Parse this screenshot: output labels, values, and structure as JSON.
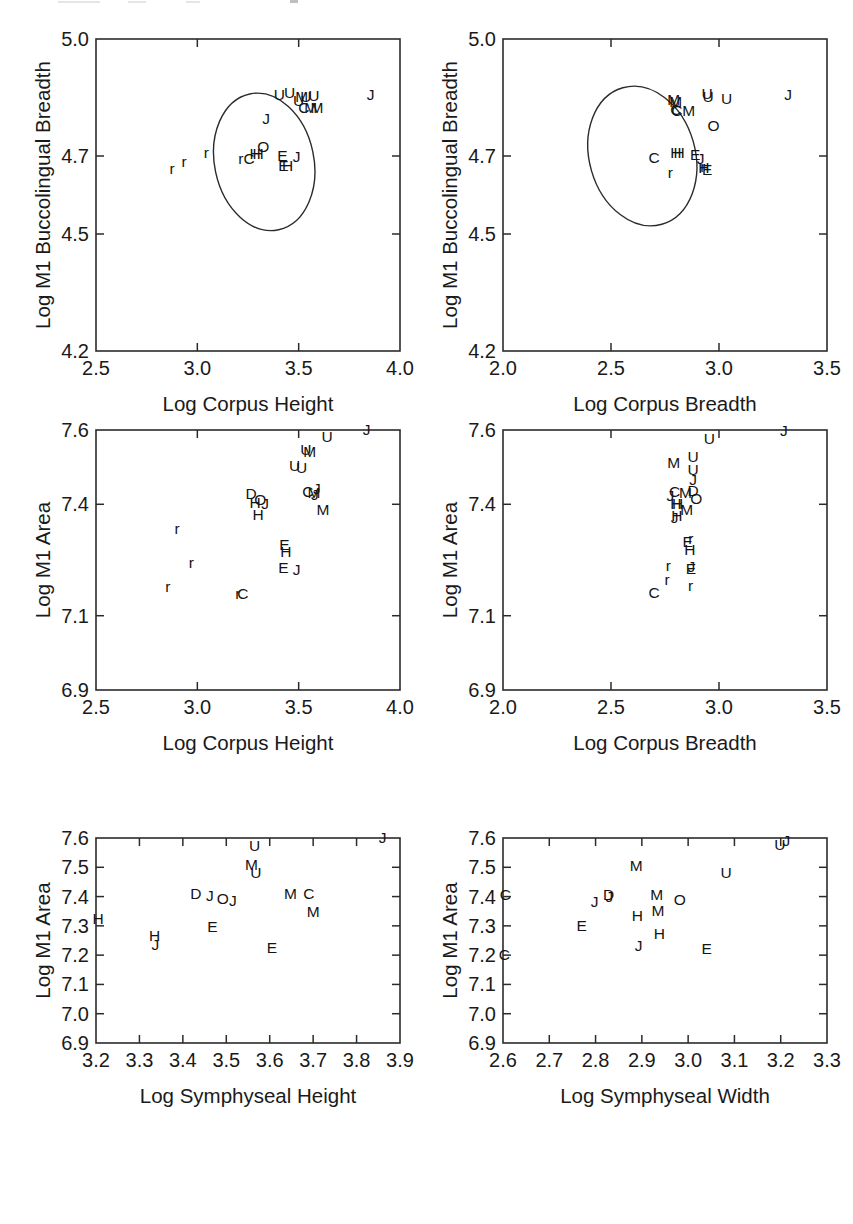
{
  "figure": {
    "title": "",
    "background": "#ffffff",
    "ink_color": "#1a1a1a",
    "panel_count": 6,
    "layout": "3 rows x 2 columns"
  },
  "chart_data": [
    {
      "id": "panel-1",
      "type": "scatter",
      "title": "",
      "xlabel": "Log Corpus Height",
      "ylabel": "Log M1 Buccolingual Breadth",
      "xlim": [
        2.5,
        4.0
      ],
      "ylim": [
        4.2,
        5.0
      ],
      "xticks": [
        2.5,
        3.0,
        3.5,
        4.0
      ],
      "xticklabels": [
        "2.5",
        "3.0",
        "3.5",
        "4.0"
      ],
      "yticks": [
        4.2,
        4.5,
        4.7,
        5.0
      ],
      "yticklabels": [
        "4.2",
        "4.5",
        "4.7",
        "5.0"
      ],
      "grid": false,
      "legend": "none",
      "marker_style": "text-letter",
      "annotations": [
        {
          "kind": "ellipse",
          "label": "confidence-ellipse",
          "cx": 3.33,
          "cy": 4.685,
          "rx": 0.245,
          "ry": 0.178,
          "rotation": -12
        }
      ],
      "points": [
        {
          "label": "r",
          "x": 2.875,
          "y": 4.665
        },
        {
          "label": "r",
          "x": 2.935,
          "y": 4.682
        },
        {
          "label": "r",
          "x": 3.045,
          "y": 4.706
        },
        {
          "label": "r",
          "x": 3.215,
          "y": 4.689
        },
        {
          "label": "C",
          "x": 3.255,
          "y": 4.69
        },
        {
          "label": "H",
          "x": 3.285,
          "y": 4.703
        },
        {
          "label": "H",
          "x": 3.3,
          "y": 4.703
        },
        {
          "label": "O",
          "x": 3.325,
          "y": 4.721
        },
        {
          "label": "J",
          "x": 3.34,
          "y": 4.793
        },
        {
          "label": "E",
          "x": 3.42,
          "y": 4.697
        },
        {
          "label": "E",
          "x": 3.425,
          "y": 4.672
        },
        {
          "label": "H",
          "x": 3.445,
          "y": 4.672
        },
        {
          "label": "J",
          "x": 3.49,
          "y": 4.696
        },
        {
          "label": "U",
          "x": 3.405,
          "y": 4.855
        },
        {
          "label": "U",
          "x": 3.455,
          "y": 4.858
        },
        {
          "label": "U",
          "x": 3.5,
          "y": 4.838
        },
        {
          "label": "M",
          "x": 3.515,
          "y": 4.848
        },
        {
          "label": "U",
          "x": 3.535,
          "y": 4.85
        },
        {
          "label": "U",
          "x": 3.575,
          "y": 4.852
        },
        {
          "label": "C",
          "x": 3.525,
          "y": 4.82
        },
        {
          "label": "M",
          "x": 3.56,
          "y": 4.82
        },
        {
          "label": "M",
          "x": 3.59,
          "y": 4.82
        },
        {
          "label": "J",
          "x": 3.855,
          "y": 4.855
        }
      ]
    },
    {
      "id": "panel-2",
      "type": "scatter",
      "title": "",
      "xlabel": "Log Corpus Breadth",
      "ylabel": "Log M1 Buccolingual Breadth",
      "xlim": [
        2.0,
        3.5
      ],
      "ylim": [
        4.2,
        5.0
      ],
      "xticks": [
        2.0,
        2.5,
        3.0,
        3.5
      ],
      "xticklabels": [
        "2.0",
        "2.5",
        "3.0",
        "3.5"
      ],
      "yticks": [
        4.2,
        4.5,
        4.7,
        5.0
      ],
      "yticklabels": [
        "4.2",
        "4.5",
        "4.7",
        "5.0"
      ],
      "grid": false,
      "legend": "none",
      "marker_style": "text-letter",
      "annotations": [
        {
          "kind": "ellipse",
          "label": "confidence-ellipse",
          "cx": 2.645,
          "cy": 4.7,
          "rx": 0.245,
          "ry": 0.182,
          "rotation": -16
        }
      ],
      "points": [
        {
          "label": "C",
          "x": 2.7,
          "y": 4.692
        },
        {
          "label": "r",
          "x": 2.775,
          "y": 4.655
        },
        {
          "label": "H",
          "x": 2.8,
          "y": 4.706
        },
        {
          "label": "H",
          "x": 2.815,
          "y": 4.706
        },
        {
          "label": "M",
          "x": 2.79,
          "y": 4.84
        },
        {
          "label": "M",
          "x": 2.8,
          "y": 4.835
        },
        {
          "label": "C",
          "x": 2.8,
          "y": 4.815
        },
        {
          "label": "C",
          "x": 2.805,
          "y": 4.812
        },
        {
          "label": "M",
          "x": 2.86,
          "y": 4.812
        },
        {
          "label": "E",
          "x": 2.89,
          "y": 4.7
        },
        {
          "label": "J",
          "x": 2.915,
          "y": 4.69
        },
        {
          "label": "r",
          "x": 2.925,
          "y": 4.67
        },
        {
          "label": "H",
          "x": 2.93,
          "y": 4.666
        },
        {
          "label": "E",
          "x": 2.945,
          "y": 4.662
        },
        {
          "label": "U",
          "x": 2.945,
          "y": 4.856
        },
        {
          "label": "U",
          "x": 2.95,
          "y": 4.848
        },
        {
          "label": "O",
          "x": 2.975,
          "y": 4.775
        },
        {
          "label": "U",
          "x": 3.035,
          "y": 4.845
        },
        {
          "label": "J",
          "x": 3.32,
          "y": 4.855
        }
      ]
    },
    {
      "id": "panel-3",
      "type": "scatter",
      "title": "",
      "xlabel": "Log Corpus Height",
      "ylabel": "Log M1 Area",
      "xlim": [
        2.5,
        4.0
      ],
      "ylim": [
        6.9,
        7.6
      ],
      "xticks": [
        2.5,
        3.0,
        3.5,
        4.0
      ],
      "xticklabels": [
        "2.5",
        "3.0",
        "3.5",
        "4.0"
      ],
      "yticks": [
        6.9,
        7.1,
        7.4,
        7.6
      ],
      "yticklabels": [
        "6.9",
        "7.1",
        "7.4",
        "7.6"
      ],
      "grid": false,
      "legend": "none",
      "marker_style": "text-letter",
      "annotations": [],
      "points": [
        {
          "label": "r",
          "x": 2.855,
          "y": 7.175
        },
        {
          "label": "r",
          "x": 2.9,
          "y": 7.33
        },
        {
          "label": "r",
          "x": 2.97,
          "y": 7.24
        },
        {
          "label": "r",
          "x": 3.2,
          "y": 7.155
        },
        {
          "label": "C",
          "x": 3.225,
          "y": 7.155
        },
        {
          "label": "D",
          "x": 3.265,
          "y": 7.425
        },
        {
          "label": "H",
          "x": 3.285,
          "y": 7.4
        },
        {
          "label": "O",
          "x": 3.31,
          "y": 7.41
        },
        {
          "label": "J",
          "x": 3.335,
          "y": 7.398
        },
        {
          "label": "H",
          "x": 3.3,
          "y": 7.368
        },
        {
          "label": "E",
          "x": 3.43,
          "y": 7.288
        },
        {
          "label": "H",
          "x": 3.437,
          "y": 7.268
        },
        {
          "label": "E",
          "x": 3.425,
          "y": 7.225
        },
        {
          "label": "J",
          "x": 3.49,
          "y": 7.22
        },
        {
          "label": "U",
          "x": 3.48,
          "y": 7.5
        },
        {
          "label": "U",
          "x": 3.515,
          "y": 7.495
        },
        {
          "label": "U",
          "x": 3.535,
          "y": 7.545
        },
        {
          "label": "M",
          "x": 3.555,
          "y": 7.538
        },
        {
          "label": "C",
          "x": 3.545,
          "y": 7.43
        },
        {
          "label": "M",
          "x": 3.575,
          "y": 7.428
        },
        {
          "label": "J",
          "x": 3.59,
          "y": 7.44
        },
        {
          "label": "J",
          "x": 3.58,
          "y": 7.422
        },
        {
          "label": "M",
          "x": 3.62,
          "y": 7.382
        },
        {
          "label": "U",
          "x": 3.64,
          "y": 7.578
        },
        {
          "label": "J",
          "x": 3.835,
          "y": 7.597
        }
      ]
    },
    {
      "id": "panel-4",
      "type": "scatter",
      "title": "",
      "xlabel": "Log Corpus Breadth",
      "ylabel": "Log M1 Area",
      "xlim": [
        2.0,
        3.5
      ],
      "ylim": [
        6.9,
        7.6
      ],
      "xticks": [
        2.0,
        2.5,
        3.0,
        3.5
      ],
      "xticklabels": [
        "2.0",
        "2.5",
        "3.0",
        "3.5"
      ],
      "yticks": [
        6.9,
        7.1,
        7.4,
        7.6
      ],
      "yticklabels": [
        "6.9",
        "7.1",
        "7.4",
        "7.6"
      ],
      "grid": false,
      "legend": "none",
      "marker_style": "text-letter",
      "annotations": [],
      "points": [
        {
          "label": "C",
          "x": 2.7,
          "y": 7.16
        },
        {
          "label": "r",
          "x": 2.76,
          "y": 7.195
        },
        {
          "label": "r",
          "x": 2.765,
          "y": 7.232
        },
        {
          "label": "J",
          "x": 2.775,
          "y": 7.42
        },
        {
          "label": "C",
          "x": 2.795,
          "y": 7.43
        },
        {
          "label": "H",
          "x": 2.8,
          "y": 7.398
        },
        {
          "label": "H",
          "x": 2.808,
          "y": 7.398
        },
        {
          "label": "J",
          "x": 2.795,
          "y": 7.36
        },
        {
          "label": "H",
          "x": 2.805,
          "y": 7.365
        },
        {
          "label": "M",
          "x": 2.79,
          "y": 7.51
        },
        {
          "label": "M",
          "x": 2.845,
          "y": 7.428
        },
        {
          "label": "M",
          "x": 2.85,
          "y": 7.382
        },
        {
          "label": "E",
          "x": 2.855,
          "y": 7.295
        },
        {
          "label": "H",
          "x": 2.865,
          "y": 7.275
        },
        {
          "label": "r",
          "x": 2.87,
          "y": 7.305
        },
        {
          "label": "E",
          "x": 2.87,
          "y": 7.222
        },
        {
          "label": "J",
          "x": 2.872,
          "y": 7.228
        },
        {
          "label": "r",
          "x": 2.868,
          "y": 7.178
        },
        {
          "label": "D",
          "x": 2.88,
          "y": 7.432
        },
        {
          "label": "O",
          "x": 2.895,
          "y": 7.412
        },
        {
          "label": "J",
          "x": 2.88,
          "y": 7.462
        },
        {
          "label": "U",
          "x": 2.88,
          "y": 7.49
        },
        {
          "label": "U",
          "x": 2.88,
          "y": 7.525
        },
        {
          "label": "U",
          "x": 2.955,
          "y": 7.572
        },
        {
          "label": "J",
          "x": 3.3,
          "y": 7.595
        }
      ]
    },
    {
      "id": "panel-5",
      "type": "scatter",
      "title": "",
      "xlabel": "Log Symphyseal Height",
      "ylabel": "Log M1 Area",
      "xlim": [
        3.2,
        3.9
      ],
      "ylim": [
        6.9,
        7.6
      ],
      "xticks": [
        3.2,
        3.3,
        3.4,
        3.5,
        3.6,
        3.7,
        3.8,
        3.9
      ],
      "xticklabels": [
        "3.2",
        "3.3",
        "3.4",
        "3.5",
        "3.6",
        "3.7",
        "3.8",
        "3.9"
      ],
      "yticks": [
        6.9,
        7.0,
        7.1,
        7.2,
        7.3,
        7.4,
        7.5,
        7.6
      ],
      "yticklabels": [
        "6.9",
        "7.0",
        "7.1",
        "7.2",
        "7.3",
        "7.4",
        "7.5",
        "7.6"
      ],
      "grid": false,
      "legend": "none",
      "marker_style": "text-letter",
      "annotations": [],
      "points": [
        {
          "label": "H",
          "x": 3.205,
          "y": 7.322
        },
        {
          "label": "H",
          "x": 3.335,
          "y": 7.262
        },
        {
          "label": "J",
          "x": 3.337,
          "y": 7.232
        },
        {
          "label": "D",
          "x": 3.43,
          "y": 7.405
        },
        {
          "label": "J",
          "x": 3.462,
          "y": 7.398
        },
        {
          "label": "E",
          "x": 3.468,
          "y": 7.292
        },
        {
          "label": "O",
          "x": 3.492,
          "y": 7.388
        },
        {
          "label": "J",
          "x": 3.515,
          "y": 7.382
        },
        {
          "label": "U",
          "x": 3.565,
          "y": 7.568
        },
        {
          "label": "M",
          "x": 3.558,
          "y": 7.505
        },
        {
          "label": "U",
          "x": 3.568,
          "y": 7.478
        },
        {
          "label": "E",
          "x": 3.605,
          "y": 7.222
        },
        {
          "label": "M",
          "x": 3.648,
          "y": 7.405
        },
        {
          "label": "C",
          "x": 3.69,
          "y": 7.405
        },
        {
          "label": "M",
          "x": 3.7,
          "y": 7.345
        },
        {
          "label": "J",
          "x": 3.86,
          "y": 7.597
        }
      ]
    },
    {
      "id": "panel-6",
      "type": "scatter",
      "title": "",
      "xlabel": "Log Symphyseal Width",
      "ylabel": "Log M1 Area",
      "xlim": [
        2.6,
        3.3
      ],
      "ylim": [
        6.9,
        7.6
      ],
      "xticks": [
        2.6,
        2.7,
        2.8,
        2.9,
        3.0,
        3.1,
        3.2,
        3.3
      ],
      "xticklabels": [
        "2.6",
        "2.7",
        "2.8",
        "2.9",
        "3.0",
        "3.1",
        "3.2",
        "3.3"
      ],
      "yticks": [
        6.9,
        7.0,
        7.1,
        7.2,
        7.3,
        7.4,
        7.5,
        7.6
      ],
      "yticklabels": [
        "6.9",
        "7.0",
        "7.1",
        "7.2",
        "7.3",
        "7.4",
        "7.5",
        "7.6"
      ],
      "grid": false,
      "legend": "none",
      "marker_style": "text-letter",
      "annotations": [],
      "points": [
        {
          "label": "C",
          "x": 2.605,
          "y": 7.402
        },
        {
          "label": "C",
          "x": 2.603,
          "y": 7.198
        },
        {
          "label": "E",
          "x": 2.77,
          "y": 7.295
        },
        {
          "label": "J",
          "x": 2.798,
          "y": 7.378
        },
        {
          "label": "D",
          "x": 2.828,
          "y": 7.402
        },
        {
          "label": "J",
          "x": 2.83,
          "y": 7.396
        },
        {
          "label": "M",
          "x": 2.888,
          "y": 7.502
        },
        {
          "label": "H",
          "x": 2.89,
          "y": 7.33
        },
        {
          "label": "J",
          "x": 2.893,
          "y": 7.228
        },
        {
          "label": "M",
          "x": 2.932,
          "y": 7.402
        },
        {
          "label": "M",
          "x": 2.935,
          "y": 7.348
        },
        {
          "label": "H",
          "x": 2.938,
          "y": 7.268
        },
        {
          "label": "O",
          "x": 2.982,
          "y": 7.385
        },
        {
          "label": "E",
          "x": 3.04,
          "y": 7.218
        },
        {
          "label": "U",
          "x": 3.082,
          "y": 7.478
        },
        {
          "label": "U",
          "x": 3.198,
          "y": 7.572
        },
        {
          "label": "J",
          "x": 3.212,
          "y": 7.588
        }
      ]
    }
  ]
}
